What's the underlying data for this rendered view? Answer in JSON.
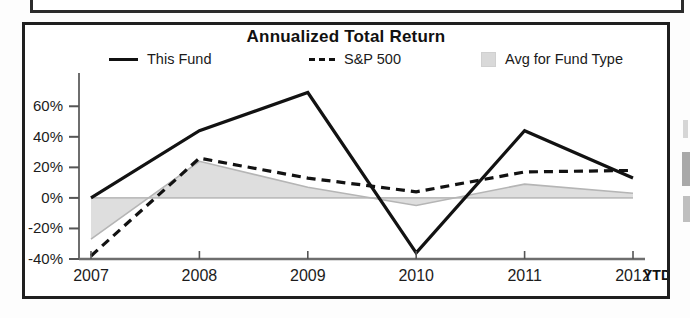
{
  "chart": {
    "title": "Annualized Total Return",
    "legend": [
      {
        "label": "This Fund",
        "marker": "solid-line-swatch",
        "color": "#111111"
      },
      {
        "label": "S&P 500",
        "marker": "dashed-line-swatch",
        "color": "#111111"
      },
      {
        "label": "Avg for Fund Type",
        "marker": "area-swatch",
        "color": "#d9d9d9"
      }
    ],
    "y_ticks": [
      "60%",
      "40%",
      "20%",
      "0%",
      "-20%",
      "-40%"
    ],
    "x_ticks": [
      "2007",
      "2008",
      "2009",
      "2010",
      "2011",
      "2012"
    ],
    "x_suffix": "YTD"
  },
  "chart_data": {
    "type": "line",
    "title": "Annualized Total Return",
    "xlabel": "",
    "ylabel": "",
    "categories": [
      "2007",
      "2008",
      "2009",
      "2010",
      "2011",
      "2012 YTD"
    ],
    "ylim": [
      -40,
      70
    ],
    "ytick_values": [
      60,
      40,
      20,
      0,
      -20,
      -40
    ],
    "ytick_labels": [
      "60%",
      "40%",
      "20%",
      "0%",
      "-20%",
      "-40%"
    ],
    "grid": false,
    "legend_position": "top",
    "series": [
      {
        "name": "This Fund",
        "style": "solid",
        "color": "#111111",
        "values": [
          0,
          44,
          69,
          -36,
          44,
          13
        ]
      },
      {
        "name": "S&P 500",
        "style": "dashed",
        "color": "#111111",
        "values": [
          -38,
          26,
          13,
          4,
          17,
          18
        ]
      },
      {
        "name": "Avg for Fund Type",
        "style": "filled-area",
        "color": "#d9d9d9",
        "values": [
          -27,
          24,
          7,
          -5,
          9,
          3
        ]
      }
    ]
  }
}
